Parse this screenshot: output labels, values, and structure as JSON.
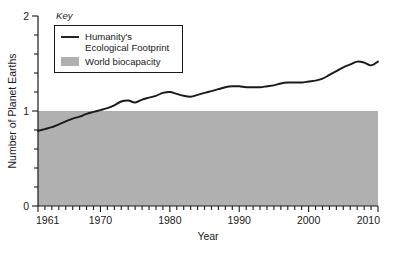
{
  "legend": {
    "heading": "Key",
    "items": [
      {
        "label_line1": "Humanity's",
        "label_line2": "Ecological Footprint",
        "swatch": "line-swatch",
        "color": "#1a1a1a"
      },
      {
        "label_line1": "World biocapacity",
        "label_line2": "",
        "swatch": "area-swatch",
        "color": "#b0b0b0"
      }
    ]
  },
  "chart_data": {
    "type": "line",
    "title": "",
    "xlabel": "Year",
    "ylabel": "Number of Planet Earths",
    "xlim": [
      1961,
      2010
    ],
    "ylim": [
      0,
      2
    ],
    "grid": false,
    "legend_position": "top-left",
    "y_major_ticks": [
      0,
      1,
      2
    ],
    "y_major_tick_labels": [
      "0",
      "1",
      "2"
    ],
    "y_minor_tick_step": 0.2,
    "x_major_ticks": [
      1961,
      1970,
      1980,
      1990,
      2000,
      2010
    ],
    "x_major_tick_labels": [
      "1961",
      "1970",
      "1980",
      "1990",
      "2000",
      "2010"
    ],
    "x_minor_tick_step": 1,
    "series": [
      {
        "name": "Humanity's Ecological Footprint",
        "type": "line",
        "color": "#1a1a1a",
        "x": [
          1961,
          1962,
          1963,
          1964,
          1965,
          1966,
          1967,
          1968,
          1969,
          1970,
          1971,
          1972,
          1973,
          1974,
          1975,
          1976,
          1977,
          1978,
          1979,
          1980,
          1981,
          1982,
          1983,
          1984,
          1985,
          1986,
          1987,
          1988,
          1989,
          1990,
          1991,
          1992,
          1993,
          1994,
          1995,
          1996,
          1997,
          1998,
          1999,
          2000,
          2001,
          2002,
          2003,
          2004,
          2005,
          2006,
          2007,
          2008,
          2009,
          2010
        ],
        "values": [
          0.79,
          0.81,
          0.83,
          0.86,
          0.89,
          0.92,
          0.94,
          0.97,
          0.99,
          1.01,
          1.03,
          1.06,
          1.1,
          1.11,
          1.09,
          1.12,
          1.14,
          1.16,
          1.19,
          1.2,
          1.18,
          1.16,
          1.15,
          1.17,
          1.19,
          1.21,
          1.23,
          1.25,
          1.26,
          1.26,
          1.25,
          1.25,
          1.25,
          1.26,
          1.27,
          1.29,
          1.3,
          1.3,
          1.3,
          1.31,
          1.32,
          1.34,
          1.38,
          1.42,
          1.46,
          1.49,
          1.52,
          1.51,
          1.48,
          1.52
        ]
      },
      {
        "name": "World biocapacity",
        "type": "area",
        "color": "#b0b0b0",
        "constant_value": 1,
        "x": [
          1961,
          2010
        ],
        "values": [
          1,
          1
        ]
      }
    ]
  }
}
